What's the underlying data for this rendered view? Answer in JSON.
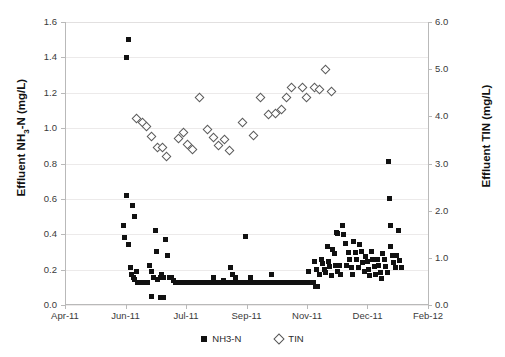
{
  "chart_data": {
    "type": "scatter",
    "title": "",
    "xlabel": "",
    "ylabel": "Effluent NH3-N (mg/L)",
    "y2label": "Effluent TIN (mg/L)",
    "ylim": [
      0.0,
      1.6
    ],
    "y2lim": [
      0.0,
      6.0
    ],
    "ytick_labels": [
      "1.6",
      "1.4",
      "1.2",
      "1.0",
      "0.8",
      "0.6",
      "0.4",
      "0.2",
      "0.0"
    ],
    "ytick_values": [
      1.6,
      1.4,
      1.2,
      1.0,
      0.8,
      0.6,
      0.4,
      0.2,
      0.0
    ],
    "y2tick_labels": [
      "6.0",
      "5.0",
      "4.0",
      "3.0",
      "2.0",
      "1.0",
      "0.0"
    ],
    "y2tick_values": [
      6.0,
      5.0,
      4.0,
      3.0,
      2.0,
      1.0,
      0.0
    ],
    "xtick_labels": [
      "Apr-11",
      "Jun-11",
      "Jul-11",
      "Sep-11",
      "Nov-11",
      "Dec-11",
      "Feb-12"
    ],
    "xtick_positions": [
      0.0,
      0.1667,
      0.3333,
      0.5,
      0.6667,
      0.8333,
      1.0
    ],
    "grid": true,
    "legend_position": "bottom-center",
    "legend": [
      "NH3-N",
      "TIN"
    ],
    "series": [
      {
        "name": "NH3-N",
        "marker": "filled-square",
        "color": "#111111",
        "axis": "left",
        "points": [
          [
            0.174,
            1.5
          ],
          [
            0.17,
            1.4
          ],
          [
            0.17,
            0.62
          ],
          [
            0.161,
            0.45
          ],
          [
            0.163,
            0.38
          ],
          [
            0.176,
            0.34
          ],
          [
            0.186,
            0.56
          ],
          [
            0.192,
            0.5
          ],
          [
            0.18,
            0.21
          ],
          [
            0.183,
            0.175
          ],
          [
            0.188,
            0.155
          ],
          [
            0.192,
            0.145
          ],
          [
            0.196,
            0.19
          ],
          [
            0.2,
            0.125
          ],
          [
            0.205,
            0.125
          ],
          [
            0.21,
            0.125
          ],
          [
            0.215,
            0.125
          ],
          [
            0.221,
            0.125
          ],
          [
            0.226,
            0.125
          ],
          [
            0.233,
            0.225
          ],
          [
            0.239,
            0.19
          ],
          [
            0.244,
            0.155
          ],
          [
            0.25,
            0.42
          ],
          [
            0.252,
            0.305
          ],
          [
            0.256,
            0.145
          ],
          [
            0.262,
            0.155
          ],
          [
            0.267,
            0.17
          ],
          [
            0.272,
            0.155
          ],
          [
            0.278,
            0.37
          ],
          [
            0.283,
            0.28
          ],
          [
            0.288,
            0.155
          ],
          [
            0.294,
            0.155
          ],
          [
            0.299,
            0.14
          ],
          [
            0.305,
            0.13
          ],
          [
            0.238,
            0.05
          ],
          [
            0.262,
            0.045
          ],
          [
            0.27,
            0.045
          ],
          [
            0.312,
            0.125
          ],
          [
            0.318,
            0.125
          ],
          [
            0.324,
            0.125
          ],
          [
            0.33,
            0.125
          ],
          [
            0.336,
            0.125
          ],
          [
            0.342,
            0.125
          ],
          [
            0.348,
            0.125
          ],
          [
            0.354,
            0.125
          ],
          [
            0.36,
            0.125
          ],
          [
            0.366,
            0.125
          ],
          [
            0.372,
            0.125
          ],
          [
            0.378,
            0.125
          ],
          [
            0.384,
            0.125
          ],
          [
            0.39,
            0.125
          ],
          [
            0.396,
            0.125
          ],
          [
            0.402,
            0.125
          ],
          [
            0.408,
            0.155
          ],
          [
            0.414,
            0.125
          ],
          [
            0.42,
            0.125
          ],
          [
            0.426,
            0.125
          ],
          [
            0.432,
            0.125
          ],
          [
            0.438,
            0.14
          ],
          [
            0.444,
            0.125
          ],
          [
            0.45,
            0.125
          ],
          [
            0.456,
            0.125
          ],
          [
            0.462,
            0.125
          ],
          [
            0.468,
            0.125
          ],
          [
            0.474,
            0.125
          ],
          [
            0.455,
            0.21
          ],
          [
            0.462,
            0.175
          ],
          [
            0.47,
            0.155
          ],
          [
            0.48,
            0.125
          ],
          [
            0.486,
            0.125
          ],
          [
            0.492,
            0.125
          ],
          [
            0.498,
            0.125
          ],
          [
            0.504,
            0.125
          ],
          [
            0.51,
            0.155
          ],
          [
            0.516,
            0.125
          ],
          [
            0.522,
            0.125
          ],
          [
            0.528,
            0.125
          ],
          [
            0.534,
            0.125
          ],
          [
            0.54,
            0.125
          ],
          [
            0.546,
            0.125
          ],
          [
            0.498,
            0.39
          ],
          [
            0.552,
            0.125
          ],
          [
            0.558,
            0.125
          ],
          [
            0.564,
            0.125
          ],
          [
            0.57,
            0.17
          ],
          [
            0.576,
            0.125
          ],
          [
            0.582,
            0.125
          ],
          [
            0.588,
            0.125
          ],
          [
            0.594,
            0.125
          ],
          [
            0.6,
            0.125
          ],
          [
            0.606,
            0.125
          ],
          [
            0.612,
            0.125
          ],
          [
            0.618,
            0.125
          ],
          [
            0.624,
            0.125
          ],
          [
            0.63,
            0.125
          ],
          [
            0.636,
            0.125
          ],
          [
            0.642,
            0.125
          ],
          [
            0.648,
            0.125
          ],
          [
            0.654,
            0.125
          ],
          [
            0.66,
            0.125
          ],
          [
            0.666,
            0.125
          ],
          [
            0.672,
            0.125
          ],
          [
            0.678,
            0.125
          ],
          [
            0.672,
            0.19
          ],
          [
            0.684,
            0.125
          ],
          [
            0.69,
            0.105
          ],
          [
            0.696,
            0.105
          ],
          [
            0.688,
            0.245
          ],
          [
            0.694,
            0.2
          ],
          [
            0.7,
            0.175
          ],
          [
            0.706,
            0.26
          ],
          [
            0.71,
            0.235
          ],
          [
            0.714,
            0.2
          ],
          [
            0.718,
            0.185
          ],
          [
            0.722,
            0.33
          ],
          [
            0.726,
            0.245
          ],
          [
            0.73,
            0.215
          ],
          [
            0.734,
            0.165
          ],
          [
            0.738,
            0.315
          ],
          [
            0.742,
            0.29
          ],
          [
            0.746,
            0.225
          ],
          [
            0.75,
            0.19
          ],
          [
            0.748,
            0.41
          ],
          [
            0.752,
            0.405
          ],
          [
            0.756,
            0.225
          ],
          [
            0.76,
            0.175
          ],
          [
            0.764,
            0.45
          ],
          [
            0.768,
            0.4
          ],
          [
            0.772,
            0.35
          ],
          [
            0.776,
            0.225
          ],
          [
            0.78,
            0.295
          ],
          [
            0.784,
            0.26
          ],
          [
            0.788,
            0.21
          ],
          [
            0.792,
            0.175
          ],
          [
            0.796,
            0.36
          ],
          [
            0.8,
            0.295
          ],
          [
            0.804,
            0.255
          ],
          [
            0.808,
            0.21
          ],
          [
            0.812,
            0.34
          ],
          [
            0.816,
            0.3
          ],
          [
            0.82,
            0.24
          ],
          [
            0.824,
            0.19
          ],
          [
            0.828,
            0.275
          ],
          [
            0.832,
            0.245
          ],
          [
            0.836,
            0.2
          ],
          [
            0.84,
            0.165
          ],
          [
            0.844,
            0.3
          ],
          [
            0.848,
            0.26
          ],
          [
            0.852,
            0.215
          ],
          [
            0.856,
            0.17
          ],
          [
            0.86,
            0.255
          ],
          [
            0.864,
            0.225
          ],
          [
            0.868,
            0.185
          ],
          [
            0.872,
            0.15
          ],
          [
            0.876,
            0.29
          ],
          [
            0.88,
            0.255
          ],
          [
            0.884,
            0.22
          ],
          [
            0.888,
            0.185
          ],
          [
            0.892,
            0.81
          ],
          [
            0.894,
            0.6
          ],
          [
            0.896,
            0.45
          ],
          [
            0.898,
            0.33
          ],
          [
            0.902,
            0.28
          ],
          [
            0.906,
            0.24
          ],
          [
            0.91,
            0.21
          ],
          [
            0.914,
            0.28
          ],
          [
            0.918,
            0.42
          ],
          [
            0.922,
            0.25
          ],
          [
            0.926,
            0.21
          ]
        ]
      },
      {
        "name": "TIN",
        "marker": "open-diamond",
        "color": "#5a5a5a",
        "axis": "right",
        "points": [
          [
            0.196,
            3.96
          ],
          [
            0.212,
            3.88
          ],
          [
            0.224,
            3.8
          ],
          [
            0.238,
            3.58
          ],
          [
            0.253,
            3.36
          ],
          [
            0.266,
            3.34
          ],
          [
            0.278,
            3.16
          ],
          [
            0.31,
            3.55
          ],
          [
            0.324,
            3.66
          ],
          [
            0.336,
            3.42
          ],
          [
            0.35,
            3.3
          ],
          [
            0.368,
            4.4
          ],
          [
            0.392,
            3.73
          ],
          [
            0.408,
            3.56
          ],
          [
            0.422,
            3.4
          ],
          [
            0.438,
            3.52
          ],
          [
            0.452,
            3.29
          ],
          [
            0.488,
            3.87
          ],
          [
            0.518,
            3.6
          ],
          [
            0.536,
            4.42
          ],
          [
            0.56,
            4.06
          ],
          [
            0.578,
            4.08
          ],
          [
            0.594,
            4.16
          ],
          [
            0.608,
            4.4
          ],
          [
            0.622,
            4.62
          ],
          [
            0.652,
            4.63
          ],
          [
            0.664,
            4.42
          ],
          [
            0.686,
            4.62
          ],
          [
            0.7,
            4.58
          ],
          [
            0.716,
            5.0
          ],
          [
            0.732,
            4.53
          ]
        ]
      }
    ]
  }
}
